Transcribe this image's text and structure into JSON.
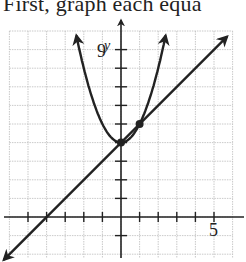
{
  "heading": "First, graph each equa",
  "chart_data": {
    "type": "line",
    "title": "",
    "xlabel": "",
    "ylabel": "y",
    "xlim": [
      -6,
      6
    ],
    "ylim": [
      -2,
      10
    ],
    "grid": true,
    "tick_labels": {
      "x": [
        "5"
      ],
      "y": [
        "9"
      ]
    },
    "series": [
      {
        "name": "parabola",
        "equation": "y = x^2 + 4",
        "x": [
          -2.4,
          -2,
          -1,
          0,
          1,
          2,
          2.4
        ],
        "values": [
          9.76,
          8,
          5,
          4,
          5,
          8,
          9.76
        ]
      },
      {
        "name": "line",
        "equation": "y = x + 4",
        "x": [
          -6.3,
          -4,
          0,
          1,
          5.7
        ],
        "values": [
          -2.3,
          0,
          4,
          5,
          9.7
        ]
      }
    ],
    "intersection_points": [
      [
        0,
        4
      ],
      [
        1,
        5
      ]
    ]
  }
}
